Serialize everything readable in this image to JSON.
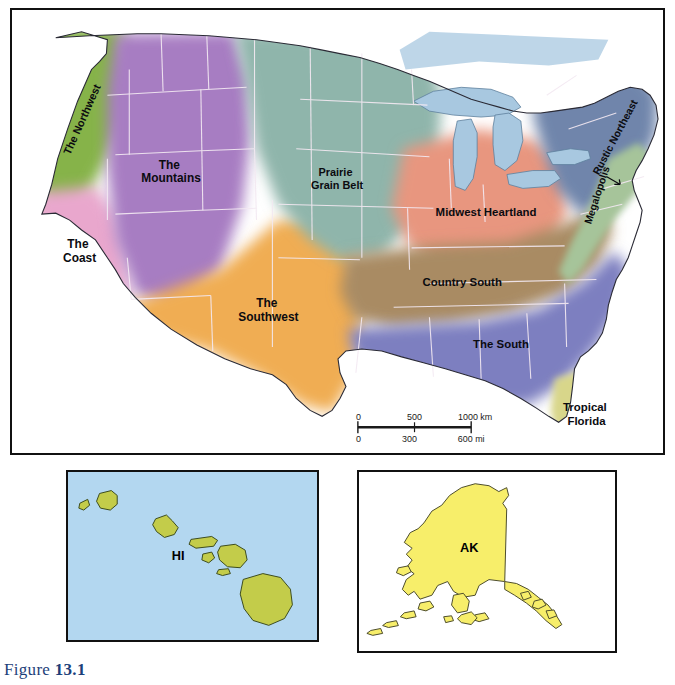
{
  "figure": {
    "prefix": "Figure",
    "number": "13.1"
  },
  "main_map": {
    "name": "united-states-vernacular-regions-map",
    "regions": [
      {
        "key": "northwest",
        "label": "The Northwest",
        "color": "#86b34a",
        "label_x": 74,
        "label_y": 112,
        "rotate": -66,
        "lines": [
          "The Northwest"
        ]
      },
      {
        "key": "mountains",
        "label": "The Mountains",
        "color": "#a77dc2",
        "label_x": 160,
        "label_y": 160,
        "rotate": 0,
        "lines": [
          "The",
          "Mountains"
        ]
      },
      {
        "key": "coast",
        "label": "The Coast",
        "color": "#e9a7cd",
        "label_x": 68,
        "label_y": 240,
        "rotate": 0,
        "lines": [
          "The",
          "Coast"
        ]
      },
      {
        "key": "southwest",
        "label": "The Southwest",
        "color": "#f0ad52",
        "label_x": 258,
        "label_y": 300,
        "rotate": 0,
        "lines": [
          "The",
          "Southwest"
        ]
      },
      {
        "key": "prairie",
        "label": "Prairie Grain Belt",
        "color": "#8fb5ab",
        "label_x": 327,
        "label_y": 168,
        "rotate": 0,
        "lines": [
          "Prairie",
          "Grain Belt"
        ]
      },
      {
        "key": "midwest",
        "label": "Midwest Heartland",
        "color": "#e8967f",
        "label_x": 477,
        "label_y": 208,
        "rotate": 0,
        "lines": [
          "Midwest Heartland"
        ]
      },
      {
        "key": "country_south",
        "label": "Country South",
        "color": "#a98b63",
        "label_x": 453,
        "label_y": 278,
        "rotate": 0,
        "lines": [
          "Country South"
        ]
      },
      {
        "key": "the_south",
        "label": "The South",
        "color": "#7d7fc0",
        "label_x": 492,
        "label_y": 341,
        "rotate": 0,
        "lines": [
          "The South"
        ]
      },
      {
        "key": "rustic_ne",
        "label": "Rustic Northeast",
        "color": "#6f85ab",
        "label_x": 610,
        "label_y": 130,
        "rotate": -62,
        "lines": [
          "Rustic Northeast"
        ]
      },
      {
        "key": "megalopolis",
        "label": "Megalopolis",
        "color": "#a6c49a",
        "label_x": 592,
        "label_y": 188,
        "rotate": -72,
        "lines": [
          "Megalopolis"
        ]
      },
      {
        "key": "tropical_fl",
        "label": "Tropical Florida",
        "color": "#d8d68a",
        "label_x": 578,
        "label_y": 405,
        "rotate": 0,
        "lines": [
          "Tropical",
          "Florida"
        ]
      }
    ],
    "water_color": "#a8c8e0",
    "scale_bar": {
      "km_labels": [
        "0",
        "500",
        "1000 km"
      ],
      "mi_labels": [
        "0",
        "300",
        "600 mi"
      ]
    }
  },
  "inset_hawaii": {
    "label": "HI",
    "land_color": "#c3cc4a",
    "ocean_color": "#b3d7f0"
  },
  "inset_alaska": {
    "label": "AK",
    "land_color": "#f7ee6a",
    "ocean_color": "#ffffff"
  }
}
